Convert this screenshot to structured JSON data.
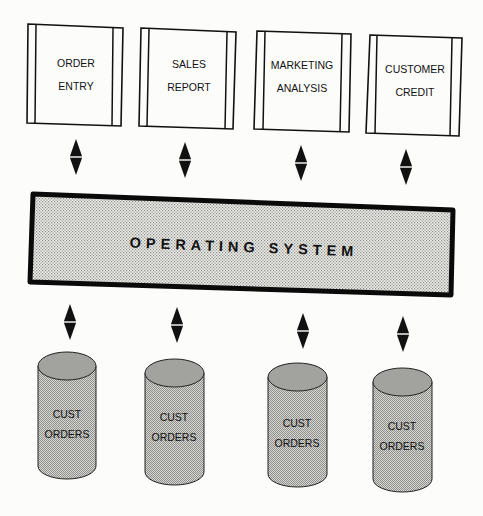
{
  "diagram": {
    "type": "architecture",
    "applications": [
      {
        "id": "order-entry",
        "line1": "ORDER",
        "line2": "ENTRY"
      },
      {
        "id": "sales-report",
        "line1": "SALES",
        "line2": "REPORT"
      },
      {
        "id": "marketing-analysis",
        "line1": "MARKETING",
        "line2": "ANALYSIS"
      },
      {
        "id": "customer-credit",
        "line1": "CUSTOMER",
        "line2": "CREDIT"
      }
    ],
    "operating_system": {
      "label": "OPERATING SYSTEM"
    },
    "databases": [
      {
        "line1": "CUST",
        "line2": "ORDERS"
      },
      {
        "line1": "CUST",
        "line2": "ORDERS"
      },
      {
        "line1": "CUST",
        "line2": "ORDERS"
      },
      {
        "line1": "CUST",
        "line2": "ORDERS"
      }
    ],
    "connections": [
      {
        "from": "ORDER ENTRY",
        "to": "OPERATING SYSTEM",
        "direction": "bidirectional"
      },
      {
        "from": "SALES REPORT",
        "to": "OPERATING SYSTEM",
        "direction": "bidirectional"
      },
      {
        "from": "MARKETING ANALYSIS",
        "to": "OPERATING SYSTEM",
        "direction": "bidirectional"
      },
      {
        "from": "CUSTOMER CREDIT",
        "to": "OPERATING SYSTEM",
        "direction": "bidirectional"
      },
      {
        "from": "OPERATING SYSTEM",
        "to": "CUST ORDERS 1",
        "direction": "bidirectional"
      },
      {
        "from": "OPERATING SYSTEM",
        "to": "CUST ORDERS 2",
        "direction": "bidirectional"
      },
      {
        "from": "OPERATING SYSTEM",
        "to": "CUST ORDERS 3",
        "direction": "bidirectional"
      },
      {
        "from": "OPERATING SYSTEM",
        "to": "CUST ORDERS 4",
        "direction": "bidirectional"
      }
    ],
    "colors": {
      "ink": "#111111",
      "paper": "#fcfcfa",
      "os_fill": "#e2e2de",
      "cylinder_body": "#c9c9c6",
      "cylinder_top": "#9e9e9b"
    }
  }
}
